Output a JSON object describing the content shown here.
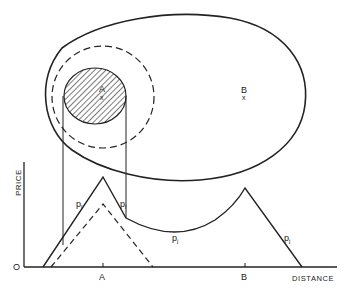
{
  "diagram": {
    "type": "market-area-and-price-profile",
    "map": {
      "market_area_outline": "solid egg-shaped boundary",
      "inner_dashed_circle": "dashed circle around A",
      "hatched_region": "hatched circle around A",
      "points": [
        {
          "label": "A",
          "marker": "x"
        },
        {
          "label": "B",
          "marker": "x"
        }
      ]
    },
    "graph": {
      "y_axis_label": "PRICE",
      "x_axis_label": "DISTANCE",
      "origin_label": "O",
      "x_ticks": [
        "A",
        "B"
      ],
      "curve_labels": {
        "pl_left": "p",
        "pl_left_sub": "l",
        "pl_right": "p",
        "pl_right_sub": "l",
        "pj_mid": "p",
        "pj_mid_sub": "j",
        "pj_right": "p",
        "pj_right_sub": "j"
      }
    }
  },
  "colors": {
    "ink": "#222222",
    "background": "#ffffff"
  }
}
